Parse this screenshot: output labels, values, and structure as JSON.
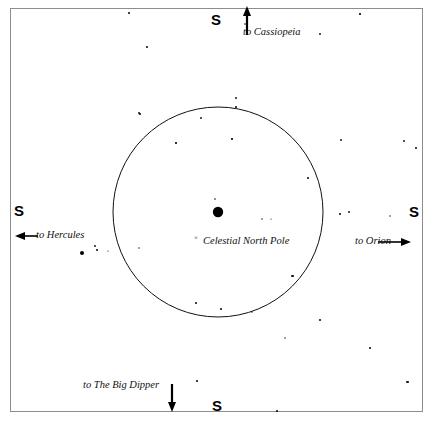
{
  "chart": {
    "background_color": "#ffffff",
    "frame_color": "#8d8d8d",
    "ink_color": "#000000"
  },
  "center_marker": {
    "polaris_label": "",
    "pole_cross": "×",
    "pole_label": "Celestial North Pole"
  },
  "directions": {
    "north": "S",
    "south": "S",
    "east": "S",
    "west": "S"
  },
  "pointers": [
    {
      "name": "to-cassiopeia",
      "label": "to Cassiopeia",
      "arrow": "up"
    },
    {
      "name": "to-orion",
      "label": "to Orion",
      "arrow": "right"
    },
    {
      "name": "to-the-big-dipper",
      "label": "to The Big Dipper",
      "arrow": "down"
    },
    {
      "name": "to-hercules",
      "label": "to Hercules",
      "arrow": "left"
    }
  ],
  "circle": {
    "cx": 218,
    "cy": 212,
    "r": 105
  },
  "chart_data": {
    "type": "scatter",
    "xlabel": "",
    "ylabel": "",
    "xlim": [
      10,
      423
    ],
    "ylim": [
      8,
      412
    ],
    "grid": false,
    "legend": "none",
    "series": [
      {
        "name": "stars",
        "points": [
          {
            "x": 218,
            "y": 212,
            "r": 5.2
          },
          {
            "x": 215,
            "y": 199,
            "r": 0.8
          },
          {
            "x": 129,
            "y": 13,
            "r": 1.0
          },
          {
            "x": 360,
            "y": 14,
            "r": 1.1
          },
          {
            "x": 147,
            "y": 47,
            "r": 1.0
          },
          {
            "x": 320,
            "y": 34,
            "r": 0.9
          },
          {
            "x": 245,
            "y": 24,
            "r": 0.8
          },
          {
            "x": 236,
            "y": 98,
            "r": 0.9
          },
          {
            "x": 236,
            "y": 107,
            "r": 1.0
          },
          {
            "x": 140,
            "y": 114,
            "r": 1.0
          },
          {
            "x": 201,
            "y": 118,
            "r": 0.9
          },
          {
            "x": 176,
            "y": 143,
            "r": 1.1
          },
          {
            "x": 232,
            "y": 139,
            "r": 1.1
          },
          {
            "x": 139,
            "y": 113,
            "r": 0.9
          },
          {
            "x": 416,
            "y": 148,
            "r": 1.0
          },
          {
            "x": 404,
            "y": 141,
            "r": 0.9
          },
          {
            "x": 341,
            "y": 140,
            "r": 0.9
          },
          {
            "x": 308,
            "y": 178,
            "r": 1.0
          },
          {
            "x": 95,
            "y": 246,
            "r": 0.9
          },
          {
            "x": 82,
            "y": 253,
            "r": 2.0
          },
          {
            "x": 97,
            "y": 250,
            "r": 1.0
          },
          {
            "x": 340,
            "y": 214,
            "r": 1.0
          },
          {
            "x": 349,
            "y": 212,
            "r": 0.9
          },
          {
            "x": 293,
            "y": 276,
            "r": 1.0
          },
          {
            "x": 196,
            "y": 303,
            "r": 1.0
          },
          {
            "x": 221,
            "y": 309,
            "r": 1.0
          },
          {
            "x": 292,
            "y": 276,
            "r": 0.9
          },
          {
            "x": 320,
            "y": 320,
            "r": 1.0
          },
          {
            "x": 370,
            "y": 348,
            "r": 1.0
          },
          {
            "x": 408,
            "y": 382,
            "r": 1.0
          },
          {
            "x": 407,
            "y": 382,
            "r": 0.9
          },
          {
            "x": 277,
            "y": 411,
            "r": 1.0
          },
          {
            "x": 197,
            "y": 381,
            "r": 1.0
          },
          {
            "x": 139,
            "y": 248,
            "r": 0.7
          },
          {
            "x": 262,
            "y": 219,
            "r": 0.7
          },
          {
            "x": 285,
            "y": 338,
            "r": 0.7
          },
          {
            "x": 252,
            "y": 312,
            "r": 0.7
          },
          {
            "x": 390,
            "y": 216,
            "r": 0.7
          },
          {
            "x": 108,
            "y": 251,
            "r": 0.6
          },
          {
            "x": 271,
            "y": 219,
            "r": 0.6
          }
        ]
      }
    ]
  }
}
